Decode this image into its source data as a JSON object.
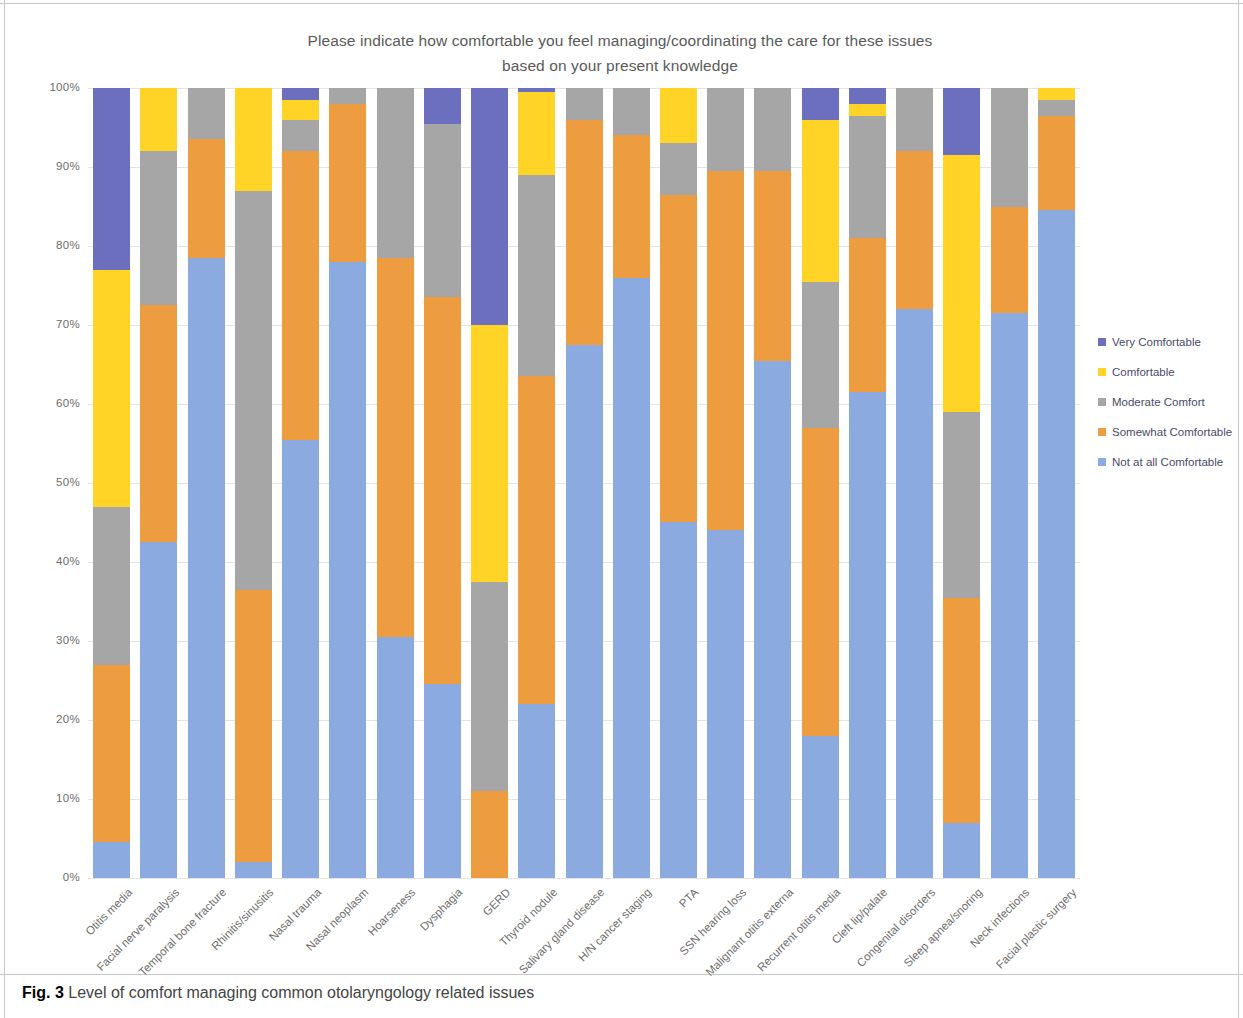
{
  "figure": {
    "caption_prefix": "Fig. 3",
    "caption_text": "Level of comfort managing common otolaryngology related issues"
  },
  "chart_data": {
    "type": "bar",
    "title": "Please indicate how comfortable you feel managing/coordinating the care for these issues based on your present knowledge",
    "title_line1": "Please indicate how comfortable you feel managing/coordinating the care for these issues",
    "title_line2": "based on your present knowledge",
    "xlabel": "",
    "ylabel": "% of Respondents",
    "ylim": [
      0,
      100
    ],
    "ytick_labels": [
      "100%",
      "90%",
      "80%",
      "70%",
      "60%",
      "50%",
      "40%",
      "30%",
      "20%",
      "10%",
      "0%"
    ],
    "ytick_values": [
      100,
      90,
      80,
      70,
      60,
      50,
      40,
      30,
      20,
      10,
      0
    ],
    "grid": true,
    "stacked": true,
    "legend_position": "right",
    "colors": {
      "very_comfortable": "#6B6FBE",
      "comfortable": "#FFD426",
      "moderate_comfort": "#A6A6A6",
      "somewhat_comfortable": "#ED9C40",
      "not_at_all_comfortable": "#8BABE0"
    },
    "categories": [
      "Otitis media",
      "Facial nerve paralysis",
      "Temporal bone fracture",
      "Rhinitis/sinusitis",
      "Nasal trauma",
      "Nasal neoplasm",
      "Hoarseness",
      "Dysphagia",
      "GERD",
      "Thyroid nodule",
      "Salivary gland disease",
      "H/N cancer staging",
      "PTA",
      "SSN hearing loss",
      "Malignant otitis externa",
      "Recurrent otitis media",
      "Cleft lip/palate",
      "Congenital disorders",
      "Sleep apnea/snoring",
      "Neck infections",
      "Facial plastic surgery"
    ],
    "series": [
      {
        "name": "Not at all Comfortable",
        "color": "#8BABE0",
        "values": [
          4.5,
          42.5,
          78.5,
          2.0,
          55.5,
          78.0,
          30.5,
          24.5,
          0.0,
          22.0,
          67.5,
          76.0,
          45.0,
          44.0,
          65.5,
          18.0,
          61.5,
          72.0,
          7.0,
          71.5,
          84.5
        ]
      },
      {
        "name": "Somewhat Comfortable",
        "color": "#ED9C40",
        "values": [
          22.5,
          30.0,
          15.0,
          34.5,
          36.5,
          20.0,
          48.0,
          49.0,
          11.0,
          41.5,
          28.5,
          18.0,
          41.5,
          45.5,
          24.0,
          39.0,
          19.5,
          20.0,
          28.5,
          13.5,
          12.0
        ]
      },
      {
        "name": "Moderate Comfort",
        "color": "#A6A6A6",
        "values": [
          20.0,
          19.5,
          6.5,
          50.5,
          4.0,
          2.0,
          21.5,
          22.0,
          26.5,
          25.5,
          4.0,
          6.0,
          6.5,
          10.5,
          10.5,
          18.5,
          15.5,
          8.0,
          23.5,
          15.0,
          2.0
        ]
      },
      {
        "name": "Comfortable",
        "color": "#FFD426",
        "values": [
          30.0,
          8.0,
          0.0,
          13.0,
          2.5,
          0.0,
          0.0,
          0.0,
          32.5,
          10.5,
          0.0,
          0.0,
          7.0,
          0.0,
          0.0,
          20.5,
          1.5,
          0.0,
          32.5,
          0.0,
          1.5
        ]
      },
      {
        "name": "Very Comfortable",
        "color": "#6B6FBE",
        "values": [
          23.0,
          0.0,
          0.0,
          0.0,
          1.5,
          0.0,
          0.0,
          4.5,
          30.0,
          0.5,
          0.0,
          0.0,
          0.0,
          0.0,
          0.0,
          4.0,
          2.0,
          0.0,
          8.5,
          0.0,
          0.0
        ]
      }
    ]
  },
  "legend": {
    "items": [
      {
        "label": "Very Comfortable",
        "color": "#6B6FBE"
      },
      {
        "label": "Comfortable",
        "color": "#FFD426"
      },
      {
        "label": "Moderate Comfort",
        "color": "#A6A6A6"
      },
      {
        "label": "Somewhat Comfortable",
        "color": "#ED9C40"
      },
      {
        "label": "Not at all Comfortable",
        "color": "#8BABE0"
      }
    ]
  }
}
